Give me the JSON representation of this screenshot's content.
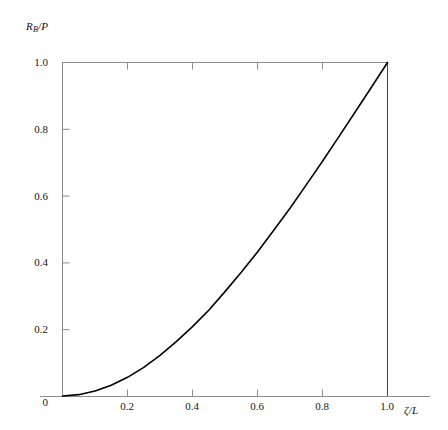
{
  "chart_data": {
    "type": "line",
    "title": "",
    "xlabel": "ζ/L",
    "ylabel": "R_B/P",
    "xlabel_display": "ζ/L",
    "ylabel_main": "R",
    "ylabel_sub": "B",
    "ylabel_tail": "/P",
    "xlim": [
      0,
      1.0
    ],
    "ylim": [
      0,
      1.0
    ],
    "grid": false,
    "legend": null,
    "xticks": [
      0,
      0.2,
      0.4,
      0.6,
      0.8,
      1.0
    ],
    "xtick_labels": [
      "",
      "0.2",
      "0.4",
      "0.6",
      "0.8",
      "1.0"
    ],
    "yticks": [
      0,
      0.2,
      0.4,
      0.6,
      0.8,
      1.0
    ],
    "ytick_labels": [
      "0",
      "0.2",
      "0.4",
      "0.6",
      "0.8",
      "1.0"
    ],
    "origin_label": "0",
    "line_color": "#000000",
    "frame_color": "#8c8c8c",
    "series": [
      {
        "name": "R_B/P",
        "x": [
          0.0,
          0.05,
          0.1,
          0.15,
          0.2,
          0.25,
          0.3,
          0.35,
          0.4,
          0.45,
          0.5,
          0.55,
          0.6,
          0.65,
          0.7,
          0.75,
          0.8,
          0.85,
          0.9,
          0.95,
          1.0
        ],
        "y": [
          0.0,
          0.004,
          0.015,
          0.032,
          0.056,
          0.086,
          0.122,
          0.163,
          0.208,
          0.257,
          0.313,
          0.371,
          0.432,
          0.497,
          0.563,
          0.633,
          0.704,
          0.777,
          0.851,
          0.925,
          1.0
        ]
      }
    ],
    "annotations": [
      {
        "name": "vertical-drop-line",
        "x": 1.0,
        "y_from": 0.0,
        "y_to": 1.0,
        "color": "#4a4a4a"
      },
      {
        "name": "top-frame-line",
        "y": 1.0,
        "x_from": 0.0,
        "x_to": 1.0,
        "color": "#8c8c8c"
      }
    ]
  },
  "axes": {
    "x_axis_name": "zeta-over-L-axis",
    "y_axis_name": "RB-over-P-axis"
  }
}
